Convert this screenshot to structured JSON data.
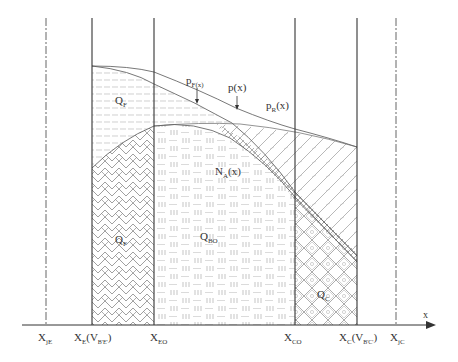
{
  "diagram": {
    "title": "",
    "axis_label": "x",
    "region_labels": {
      "qf_top": {
        "main": "Q",
        "sub": "F"
      },
      "qf_bottom": {
        "main": "Q",
        "sub": "F"
      },
      "qbo": {
        "main": "Q",
        "sub": "BO"
      },
      "qc": {
        "main": "Q",
        "sub": "C"
      }
    },
    "curve_labels": {
      "pf": {
        "main": "p",
        "sub": "F(x)",
        "tail": ""
      },
      "p": {
        "main": "p(x)",
        "sub": "",
        "tail": ""
      },
      "pr": {
        "main": "p",
        "sub": "R",
        "tail": "(x)"
      },
      "na": {
        "main": "N",
        "sub": "A",
        "tail": "(x)"
      }
    },
    "axis_ticks": [
      {
        "main": "X",
        "sub": "jE",
        "tail": "",
        "tsub": ""
      },
      {
        "main": "X",
        "sub": "E",
        "tail": "(V",
        "tsub": "B'E'",
        "end": ")"
      },
      {
        "main": "X",
        "sub": "EO",
        "tail": "",
        "tsub": ""
      },
      {
        "main": "X",
        "sub": "CO",
        "tail": "",
        "tsub": ""
      },
      {
        "main": "X",
        "sub": "C",
        "tail": "(V",
        "tsub": "B'C'",
        "end": ")"
      },
      {
        "main": "X",
        "sub": "jC",
        "tail": "",
        "tsub": ""
      }
    ],
    "colors": {
      "line": "#333333",
      "hatch": "#888888",
      "background": "#ffffff"
    }
  }
}
